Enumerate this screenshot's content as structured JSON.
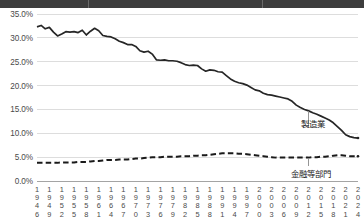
{
  "header": {
    "title_band_visible": true,
    "title_text": ""
  },
  "chart_data": {
    "type": "line",
    "title": "",
    "subtitle": "",
    "xlabel": "",
    "ylabel": "",
    "ylim": [
      0,
      35
    ],
    "ytick_values": [
      0,
      5,
      10,
      15,
      20,
      25,
      30,
      35
    ],
    "ytick_labels": [
      "0.0%",
      "5.0%",
      "10.0%",
      "15.0%",
      "20.0%",
      "25.0%",
      "30.0%",
      "35.0%"
    ],
    "grid": true,
    "grid_axis": "y",
    "legend_position": "inline-annotation",
    "xtick_labels": [
      "1946",
      "1949",
      "1952",
      "1955",
      "1958",
      "1961",
      "1964",
      "1967",
      "1970",
      "1973",
      "1976",
      "1979",
      "1982",
      "1985",
      "1988",
      "1991",
      "1994",
      "1997",
      "2000",
      "2003",
      "2006",
      "2009",
      "2012",
      "2015",
      "2018",
      "2021",
      "2024"
    ],
    "x_start": 1946,
    "x_end": 2024,
    "annotations": [
      {
        "name": "manufacturing",
        "label": "製造業",
        "points_to_year": 2012
      },
      {
        "name": "finance",
        "label": "金融等部門",
        "points_to_year": 2012
      }
    ],
    "series": [
      {
        "name": "manufacturing",
        "label": "製造業",
        "style": "solid",
        "color": "#262626",
        "x": [
          1946,
          1947,
          1948,
          1949,
          1950,
          1951,
          1952,
          1953,
          1954,
          1955,
          1956,
          1957,
          1958,
          1959,
          1960,
          1961,
          1962,
          1963,
          1964,
          1965,
          1966,
          1967,
          1968,
          1969,
          1970,
          1971,
          1972,
          1973,
          1974,
          1975,
          1976,
          1977,
          1978,
          1979,
          1980,
          1981,
          1982,
          1983,
          1984,
          1985,
          1986,
          1987,
          1988,
          1989,
          1990,
          1991,
          1992,
          1993,
          1994,
          1995,
          1996,
          1997,
          1998,
          1999,
          2000,
          2001,
          2002,
          2003,
          2004,
          2005,
          2006,
          2007,
          2008,
          2009,
          2010,
          2011,
          2012,
          2013,
          2014,
          2015,
          2016,
          2017,
          2018,
          2019,
          2020,
          2021,
          2022,
          2023,
          2024
        ],
        "values": [
          32.3,
          32.6,
          31.9,
          32.2,
          31.2,
          30.4,
          30.8,
          31.3,
          31.2,
          31.3,
          31.1,
          31.6,
          30.6,
          31.4,
          32.0,
          31.5,
          30.5,
          30.3,
          30.2,
          29.8,
          29.3,
          29.0,
          28.6,
          28.6,
          28.2,
          27.3,
          27.0,
          27.2,
          26.6,
          25.4,
          25.3,
          25.4,
          25.2,
          25.2,
          25.1,
          24.8,
          24.4,
          24.2,
          24.3,
          24.2,
          23.5,
          23.0,
          23.3,
          23.2,
          22.9,
          22.8,
          22.1,
          21.4,
          20.9,
          20.6,
          20.4,
          20.1,
          19.6,
          19.1,
          18.9,
          18.4,
          18.1,
          18.0,
          17.8,
          17.6,
          17.4,
          17.2,
          16.7,
          15.9,
          15.4,
          15.0,
          14.7,
          14.3,
          14.0,
          13.6,
          13.2,
          12.8,
          12.2,
          11.4,
          10.6,
          9.7,
          9.3,
          9.1,
          9.0
        ]
      },
      {
        "name": "finance",
        "label": "金融等部門",
        "style": "dashed",
        "color": "#1a1a1a",
        "x": [
          1946,
          1947,
          1948,
          1949,
          1950,
          1951,
          1952,
          1953,
          1954,
          1955,
          1956,
          1957,
          1958,
          1959,
          1960,
          1961,
          1962,
          1963,
          1964,
          1965,
          1966,
          1967,
          1968,
          1969,
          1970,
          1971,
          1972,
          1973,
          1974,
          1975,
          1976,
          1977,
          1978,
          1979,
          1980,
          1981,
          1982,
          1983,
          1984,
          1985,
          1986,
          1987,
          1988,
          1989,
          1990,
          1991,
          1992,
          1993,
          1994,
          1995,
          1996,
          1997,
          1998,
          1999,
          2000,
          2001,
          2002,
          2003,
          2004,
          2005,
          2006,
          2007,
          2008,
          2009,
          2010,
          2011,
          2012,
          2013,
          2014,
          2015,
          2016,
          2017,
          2018,
          2019,
          2020,
          2021,
          2022,
          2023,
          2024
        ],
        "values": [
          3.8,
          3.8,
          3.8,
          3.8,
          3.8,
          3.8,
          3.9,
          3.9,
          3.9,
          3.9,
          4.0,
          4.0,
          4.0,
          4.1,
          4.2,
          4.2,
          4.3,
          4.4,
          4.4,
          4.4,
          4.5,
          4.5,
          4.5,
          4.6,
          4.7,
          4.7,
          4.8,
          4.9,
          5.0,
          5.0,
          5.0,
          5.1,
          5.1,
          5.1,
          5.1,
          5.2,
          5.2,
          5.2,
          5.3,
          5.3,
          5.4,
          5.4,
          5.5,
          5.6,
          5.7,
          5.8,
          5.8,
          5.8,
          5.8,
          5.7,
          5.7,
          5.6,
          5.5,
          5.4,
          5.3,
          5.2,
          5.1,
          5.0,
          4.9,
          4.9,
          4.9,
          4.9,
          4.9,
          4.9,
          4.9,
          4.9,
          4.9,
          5.0,
          5.0,
          5.1,
          5.1,
          5.2,
          5.3,
          5.4,
          5.4,
          5.3,
          5.2,
          5.2,
          5.2
        ]
      }
    ]
  },
  "colors": {
    "grid": "#cfcfcf",
    "axis": "#9a9a9a",
    "text": "#4a4a4a",
    "series_dark": "#262626",
    "title_band": "#3d3d3d"
  }
}
